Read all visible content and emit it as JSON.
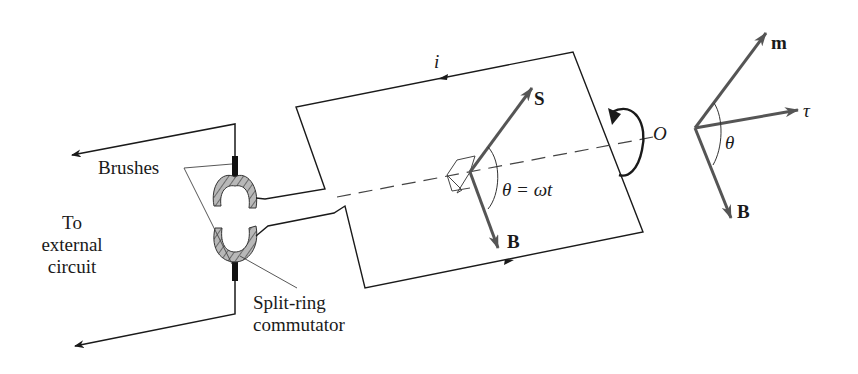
{
  "figure": {
    "labels": {
      "brushes": "Brushes",
      "external_line1": "To",
      "external_line2": "external",
      "external_line3": "circuit",
      "commutator_line1": "Split-ring",
      "commutator_line2": "commutator",
      "current": "i",
      "axis_origin": "O",
      "loop_vector_s": "S",
      "loop_vector_b": "B",
      "loop_angle": "θ = ωt",
      "right_vector_m": "m",
      "right_vector_tau": "τ",
      "right_vector_b": "B",
      "right_angle": "θ"
    },
    "colors": {
      "line": "#1a1a1a",
      "vector": "#555555",
      "commutator_fill": "#b8b8b8",
      "brush": "#111111",
      "background": "#ffffff"
    }
  }
}
